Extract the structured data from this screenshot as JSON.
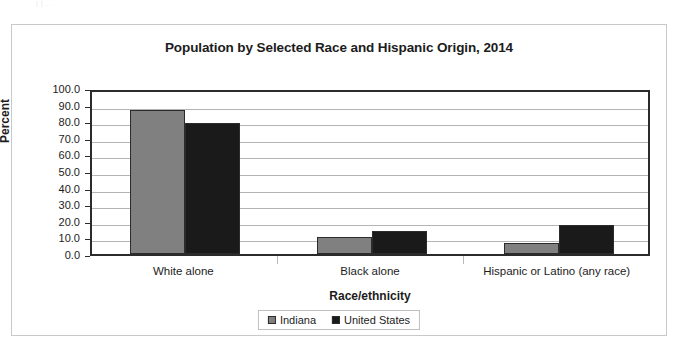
{
  "scan_artifact_text": "[ ]  .  .",
  "figure": {
    "title": "Population by Selected Race and Hispanic Origin, 2014"
  },
  "chart_data": {
    "type": "bar",
    "title": "Population by Selected Race and Hispanic Origin, 2014",
    "xlabel": "Race/ethnicity",
    "ylabel": "Percent",
    "ylim": [
      0,
      100
    ],
    "ytick_step": 10,
    "ytick_labels": [
      "100.0",
      "90.0",
      "80.0",
      "70.0",
      "60.0",
      "50.0",
      "40.0",
      "30.0",
      "20.0",
      "10.0",
      "0.0"
    ],
    "ytick_values": [
      100,
      90,
      80,
      70,
      60,
      50,
      40,
      30,
      20,
      10,
      0
    ],
    "grid": true,
    "legend_position": "bottom",
    "categories": [
      "White alone",
      "Black alone",
      "Hispanic or Latino (any race)"
    ],
    "series": [
      {
        "name": "Indiana",
        "color": "#808080",
        "values": [
          86.5,
          10.0,
          6.8
        ]
      },
      {
        "name": "United States",
        "color": "#1a1a1a",
        "values": [
          79.0,
          13.8,
          17.3
        ]
      }
    ]
  },
  "colors": {
    "indiana": "#808080",
    "united_states": "#1a1a1a",
    "axis": "#2b2b2b",
    "gridline": "#b4b4b4",
    "frame": "#c9c9c9"
  }
}
